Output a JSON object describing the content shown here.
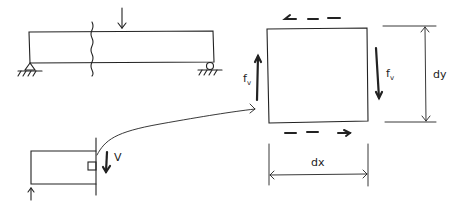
{
  "diagram": {
    "beam": {
      "load": "point-load-arrow",
      "supports": [
        "pin-support",
        "roller-support"
      ],
      "section_cut": "wavy-cut-line"
    },
    "free_body": {
      "shear_label": "V",
      "reaction": "reaction-arrow-up"
    },
    "element": {
      "left_stress_label": "f",
      "left_stress_sub": "v",
      "right_stress_label": "f",
      "right_stress_sub": "v",
      "height_label": "dy",
      "width_label": "dx"
    },
    "colors": {
      "ink": "#222222",
      "background": "#ffffff"
    }
  }
}
